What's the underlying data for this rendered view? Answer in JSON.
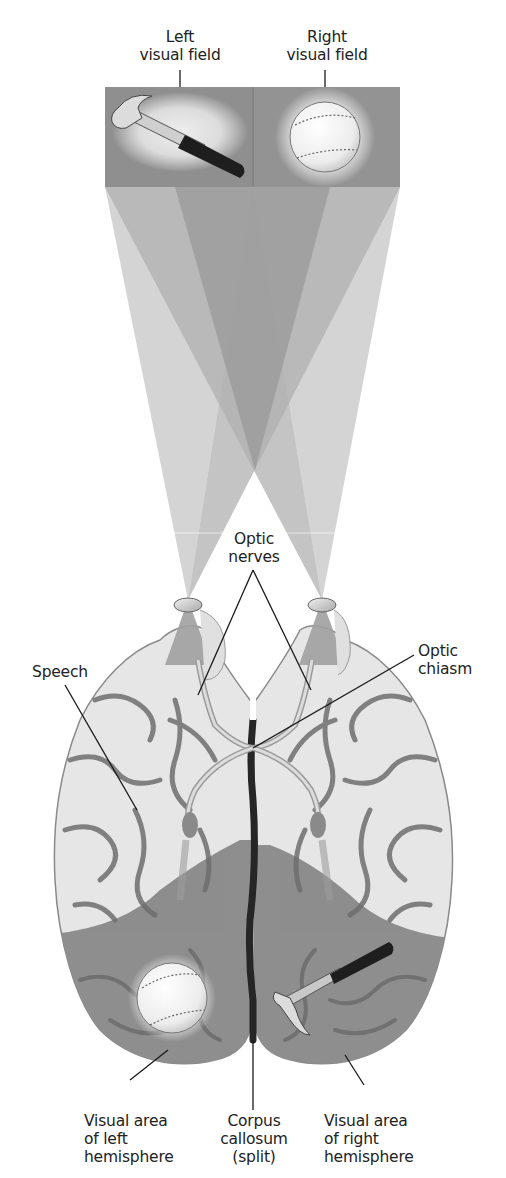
{
  "figure": {
    "visual_field_labels": {
      "left": [
        "Left",
        "visual field"
      ],
      "right": [
        "Right",
        "visual field"
      ]
    },
    "objects": {
      "left_field_object": "hammer",
      "right_field_object": "baseball",
      "left_hemisphere_object": "baseball",
      "right_hemisphere_object": "hammer"
    },
    "anatomy_labels": {
      "optic_nerves": [
        "Optic",
        "nerves"
      ],
      "optic_chiasm": [
        "Optic",
        "chiasm"
      ],
      "speech": [
        "Speech"
      ],
      "visual_area_left": [
        "Visual area",
        "of left",
        "hemisphere"
      ],
      "corpus_callosum": [
        "Corpus",
        "callosum",
        "(split)"
      ],
      "visual_area_right": [
        "Visual area",
        "of right",
        "hemisphere"
      ]
    },
    "colors": {
      "panel": "#8f8f8f",
      "beam_light": "#c8c8c8",
      "beam_mid": "#a9a9a9",
      "beam_dark": "#8a8a8a",
      "brain_light": "#e6e6e6",
      "brain_sulcus": "#6e6e6e",
      "visual_area": "#8e8e8e",
      "fissure": "#262626",
      "leader_line": "#1a1a1a"
    }
  }
}
